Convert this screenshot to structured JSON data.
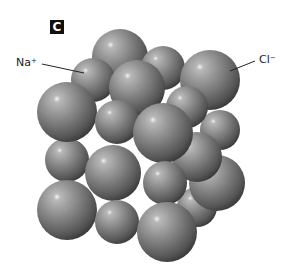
{
  "figure": {
    "panel_label": "C",
    "labels": [
      {
        "id": "na",
        "text": "Na",
        "charge": "+",
        "points_to": "small sphere (sodium ion)"
      },
      {
        "id": "cl",
        "text": "Cl",
        "charge": "−",
        "points_to": "large sphere (chloride ion)"
      }
    ],
    "colors": {
      "background": "#ffffff",
      "sphere_light": "#b5b5b5",
      "sphere_mid": "#7a7a7a",
      "sphere_dark": "#3e3e3e",
      "leader_line": "#222222",
      "panel_label_bg": "#111111",
      "panel_label_fg": "#ffffff"
    },
    "spheres": [
      {
        "cx": 120,
        "cy": 57,
        "r": 28,
        "ion": "Cl"
      },
      {
        "cx": 163,
        "cy": 68,
        "r": 22,
        "ion": "Na"
      },
      {
        "cx": 220,
        "cy": 130,
        "r": 20,
        "ion": "Na"
      },
      {
        "cx": 197,
        "cy": 207,
        "r": 20,
        "ion": "Na"
      },
      {
        "cx": 217,
        "cy": 183,
        "r": 28,
        "ion": "Cl"
      },
      {
        "cx": 210,
        "cy": 80,
        "r": 30,
        "ion": "Cl"
      },
      {
        "cx": 197,
        "cy": 157,
        "r": 25,
        "ion": "Cl"
      },
      {
        "cx": 93,
        "cy": 80,
        "r": 22,
        "ion": "Na"
      },
      {
        "cx": 187,
        "cy": 107,
        "r": 21,
        "ion": "Na"
      },
      {
        "cx": 137,
        "cy": 88,
        "r": 28,
        "ion": "Cl"
      },
      {
        "cx": 67,
        "cy": 160,
        "r": 22,
        "ion": "Na"
      },
      {
        "cx": 67,
        "cy": 112,
        "r": 30,
        "ion": "Cl"
      },
      {
        "cx": 117,
        "cy": 122,
        "r": 22,
        "ion": "Na"
      },
      {
        "cx": 113,
        "cy": 173,
        "r": 28,
        "ion": "Cl"
      },
      {
        "cx": 163,
        "cy": 133,
        "r": 30,
        "ion": "Cl"
      },
      {
        "cx": 165,
        "cy": 183,
        "r": 22,
        "ion": "Na"
      },
      {
        "cx": 67,
        "cy": 210,
        "r": 30,
        "ion": "Cl"
      },
      {
        "cx": 117,
        "cy": 222,
        "r": 22,
        "ion": "Na"
      },
      {
        "cx": 167,
        "cy": 232,
        "r": 30,
        "ion": "Cl"
      }
    ],
    "leader_lines": [
      {
        "id": "na",
        "x1": 42,
        "y1": 64,
        "x2": 84,
        "y2": 73
      },
      {
        "id": "cl",
        "x1": 255,
        "y1": 61,
        "x2": 230,
        "y2": 71
      }
    ]
  }
}
